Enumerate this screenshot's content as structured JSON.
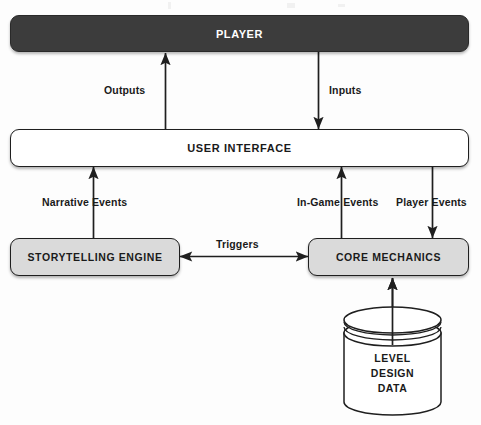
{
  "diagram": {
    "type": "block-flow-diagram",
    "title_visible": false,
    "nodes": [
      {
        "id": "player",
        "label": "PLAYER",
        "shape": "rounded-bar",
        "fill": "#3c3c3c",
        "text_color": "#ffffff"
      },
      {
        "id": "user_interface",
        "label": "USER INTERFACE",
        "shape": "rounded-bar",
        "fill": "#ffffff",
        "text_color": "#1a1a1a"
      },
      {
        "id": "storytelling",
        "label": "STORYTELLING ENGINE",
        "shape": "rounded-box",
        "fill": "#dadada",
        "text_color": "#1a1a1a"
      },
      {
        "id": "core",
        "label": "CORE MECHANICS",
        "shape": "rounded-box",
        "fill": "#dadada",
        "text_color": "#1a1a1a"
      },
      {
        "id": "database",
        "label": "LEVEL DESIGN DATA",
        "shape": "cylinder",
        "fill": "#ffffff",
        "text_color": "#1a1a1a",
        "label_lines": [
          "LEVEL",
          "DESIGN",
          "DATA"
        ]
      }
    ],
    "edges": [
      {
        "id": "outputs",
        "label": "Outputs",
        "from": "user_interface",
        "to": "player",
        "direction": "up"
      },
      {
        "id": "inputs",
        "label": "Inputs",
        "from": "player",
        "to": "user_interface",
        "direction": "down"
      },
      {
        "id": "narrative",
        "label": "Narrative Events",
        "from": "storytelling",
        "to": "user_interface",
        "direction": "up"
      },
      {
        "id": "ingame",
        "label": "In-Game Events",
        "from": "core",
        "to": "user_interface",
        "direction": "up"
      },
      {
        "id": "player_events",
        "label": "Player Events",
        "from": "user_interface",
        "to": "core",
        "direction": "down"
      },
      {
        "id": "triggers",
        "label": "Triggers",
        "from": "storytelling",
        "to": "core",
        "direction": "both"
      },
      {
        "id": "level_data",
        "label": "",
        "from": "database",
        "to": "core",
        "direction": "up"
      }
    ],
    "colors": {
      "dark_fill": "#3c3c3c",
      "gray_fill": "#dadada",
      "white_fill": "#ffffff",
      "stroke": "#1f1f1f",
      "page_background": "#fdfdfd"
    }
  }
}
